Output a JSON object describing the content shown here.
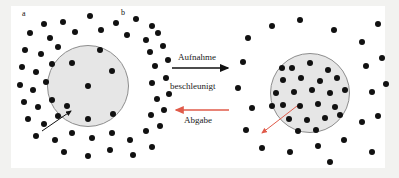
{
  "figure": {
    "type": "scientific-diagram",
    "background_color": "#f2f2f0",
    "panel_color": "#ffffff",
    "cell_fill": "#e6e6e6",
    "cell_stroke": "#8d8d8d",
    "dot_color": "#111111",
    "accent_red": "#e05b4a",
    "accent_black": "#111111"
  },
  "labels": {
    "panel_a": "a",
    "panel_b": "b"
  },
  "arrows": {
    "top": {
      "text": "Aufnahme",
      "direction": "right",
      "color": "#111111"
    },
    "middle": {
      "text": "beschleunigt",
      "direction": "none",
      "color": "#1a1a1a"
    },
    "bottom": {
      "text": "Abgabe",
      "direction": "left",
      "color": "#e05b4a"
    }
  },
  "pointers": {
    "left_cell": {
      "name": "cell-pointer-left",
      "color": "#111111",
      "from": [
        42,
        131
      ],
      "to": [
        71,
        111
      ]
    },
    "right_cell": {
      "name": "cell-pointer-right",
      "color": "#e05b4a",
      "from": [
        297,
        106
      ],
      "to": [
        262,
        133
      ]
    }
  },
  "cells": [
    {
      "name": "cell-left",
      "cx": 88,
      "cy": 86,
      "r": 41
    },
    {
      "name": "cell-right",
      "cx": 310,
      "cy": 93,
      "r": 40
    }
  ],
  "chart_data": {
    "type": "scatter",
    "xlabel": "",
    "ylabel": "",
    "legend": [
      "Aufnahme",
      "beschleunigt",
      "Abgabe"
    ],
    "annotations": [
      "a",
      "b",
      "Aufnahme",
      "beschleunigt",
      "Abgabe"
    ],
    "series": [
      {
        "name": "teilchen-innen-links",
        "description": "Teilchen innerhalb der linken Zelle (geringe Konzentration)",
        "count": 7,
        "points": [
          [
            72,
            63
          ],
          [
            112,
            71
          ],
          [
            88,
            86
          ],
          [
            67,
            106
          ],
          [
            113,
            114
          ],
          [
            88,
            119
          ],
          [
            100,
            50
          ]
        ]
      },
      {
        "name": "teilchen-aussen-links",
        "description": "Teilchen ausserhalb der linken Zelle (hohe Konzentration)",
        "count": 48,
        "points": [
          [
            44,
            24
          ],
          [
            63,
            22
          ],
          [
            90,
            16
          ],
          [
            116,
            23
          ],
          [
            136,
            19
          ],
          [
            152,
            26
          ],
          [
            30,
            33
          ],
          [
            50,
            38
          ],
          [
            75,
            32
          ],
          [
            101,
            30
          ],
          [
            127,
            35
          ],
          [
            146,
            40
          ],
          [
            158,
            33
          ],
          [
            25,
            50
          ],
          [
            41,
            54
          ],
          [
            58,
            47
          ],
          [
            150,
            52
          ],
          [
            163,
            46
          ],
          [
            22,
            67
          ],
          [
            36,
            72
          ],
          [
            52,
            64
          ],
          [
            155,
            66
          ],
          [
            168,
            60
          ],
          [
            20,
            85
          ],
          [
            33,
            90
          ],
          [
            46,
            82
          ],
          [
            152,
            83
          ],
          [
            166,
            78
          ],
          [
            24,
            102
          ],
          [
            38,
            107
          ],
          [
            52,
            100
          ],
          [
            157,
            99
          ],
          [
            169,
            94
          ],
          [
            28,
            119
          ],
          [
            44,
            124
          ],
          [
            58,
            116
          ],
          [
            151,
            115
          ],
          [
            164,
            110
          ],
          [
            36,
            136
          ],
          [
            55,
            140
          ],
          [
            72,
            133
          ],
          [
            92,
            138
          ],
          [
            112,
            133
          ],
          [
            130,
            140
          ],
          [
            146,
            131
          ],
          [
            160,
            126
          ],
          [
            64,
            152
          ],
          [
            88,
            156
          ],
          [
            110,
            150
          ],
          [
            133,
            155
          ],
          [
            152,
            147
          ]
        ]
      },
      {
        "name": "teilchen-innen-rechts",
        "description": "Teilchen innerhalb der rechten Zelle (hohe Konzentration)",
        "count": 24,
        "points": [
          [
            292,
            68
          ],
          [
            310,
            63
          ],
          [
            328,
            70
          ],
          [
            283,
            80
          ],
          [
            301,
            78
          ],
          [
            320,
            81
          ],
          [
            337,
            78
          ],
          [
            276,
            93
          ],
          [
            294,
            92
          ],
          [
            312,
            90
          ],
          [
            330,
            93
          ],
          [
            345,
            90
          ],
          [
            283,
            105
          ],
          [
            300,
            106
          ],
          [
            318,
            104
          ],
          [
            335,
            107
          ],
          [
            289,
            119
          ],
          [
            307,
            120
          ],
          [
            325,
            118
          ],
          [
            340,
            115
          ],
          [
            298,
            131
          ],
          [
            316,
            130
          ],
          [
            272,
            106
          ],
          [
            282,
            68
          ]
        ]
      },
      {
        "name": "teilchen-aussen-rechts",
        "description": "Teilchen ausserhalb der rechten Zelle (geringe Konzentration)",
        "count": 22,
        "points": [
          [
            248,
            38
          ],
          [
            272,
            26
          ],
          [
            300,
            20
          ],
          [
            334,
            30
          ],
          [
            362,
            42
          ],
          [
            378,
            24
          ],
          [
            243,
            62
          ],
          [
            366,
            66
          ],
          [
            382,
            58
          ],
          [
            238,
            88
          ],
          [
            252,
            108
          ],
          [
            372,
            92
          ],
          [
            386,
            84
          ],
          [
            246,
            130
          ],
          [
            262,
            148
          ],
          [
            290,
            152
          ],
          [
            318,
            146
          ],
          [
            344,
            140
          ],
          [
            362,
            122
          ],
          [
            378,
            116
          ],
          [
            330,
            162
          ],
          [
            372,
            152
          ]
        ]
      }
    ]
  }
}
